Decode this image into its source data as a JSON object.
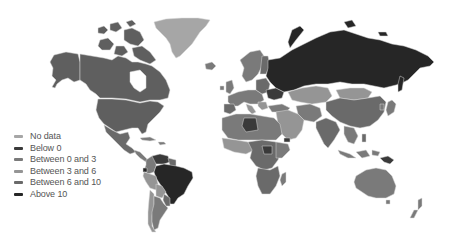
{
  "map": {
    "type": "choropleth",
    "projection": "world",
    "background": "#ffffff",
    "border_color": "#d9d9d9"
  },
  "legend": {
    "position": "bottom-left",
    "items": [
      {
        "label": "No data",
        "color": "#a6a6a6"
      },
      {
        "label": "Below 0",
        "color": "#3a3a3a"
      },
      {
        "label": "Between 0 and 3",
        "color": "#7a7a7a"
      },
      {
        "label": "Between 3 and 6",
        "color": "#959595"
      },
      {
        "label": "Between 6 and 10",
        "color": "#6a6a6a"
      },
      {
        "label": "Above 10",
        "color": "#262626"
      }
    ]
  },
  "regions": {
    "no_data": [
      "Greenland"
    ],
    "below_0": [
      "Libya",
      "South Sudan",
      "Ukraine",
      "Venezuela",
      "Papua New Guinea"
    ],
    "between_0_and_3": [
      "Canada",
      "United States",
      "Alaska",
      "Argentina",
      "Western Europe",
      "Japan",
      "Australia"
    ],
    "between_3_and_6": [
      "Kazakhstan",
      "Mongolia",
      "Peru",
      "Chile",
      "Middle East"
    ],
    "between_6_and_10": [
      "China",
      "India",
      "Africa",
      "Southeast Asia",
      "Central America"
    ],
    "above_10": [
      "Russia",
      "Brazil"
    ]
  }
}
